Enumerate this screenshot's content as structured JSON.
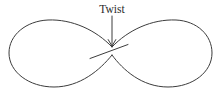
{
  "figure": {
    "kind": "line-diagram",
    "title_visible": false,
    "background_color": "#ffffff",
    "width": 221,
    "height": 98
  },
  "annotation": {
    "label": "Twist",
    "label_x": 112,
    "label_y": 13,
    "font_size_px": 11.5,
    "color": "#2b2b2b"
  },
  "arrow": {
    "name": "pointer-arrow",
    "color": "#3c3c3c",
    "shaft_path": "M 112 16 L 112 45",
    "head_path": "M 108.2 39.6 L 112 46.2 L 115.8 39.6"
  },
  "curve": {
    "name": "figure-eight-loop",
    "color": "#3c3c3c",
    "stroke_width": 1,
    "left_lobe_path": "M 112 47 C 96 30 72 19 48 20 C 26 21 9 35 9 53 C 9 72 29 87 54 87 C 80 87 100 70 112 55",
    "right_lobe_path": "M 112 47 C 128 30 152 19 176 20 C 197 21 212 35 212 53 C 212 72 193 87 168 87 C 142 87 123 70 112 55",
    "crossing_x": 112,
    "crossing_y": 50
  },
  "twist_mark": {
    "name": "twist-crossing-stroke",
    "color": "#3c3c3c",
    "path": "M 90 58.5 L 128 44.5"
  }
}
